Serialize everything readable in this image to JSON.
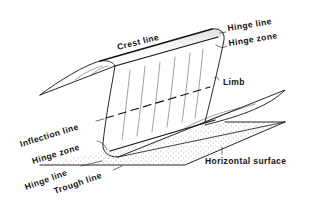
{
  "diagram": {
    "type": "3D fold block diagram",
    "labels": {
      "crest_line": "Crest line",
      "hinge_line_top": "Hinge line",
      "hinge_zone_top": "Hinge zone",
      "limb": "Limb",
      "inflection_line": "Inflection line",
      "hinge_zone_bottom": "Hinge zone",
      "hinge_line_bottom": "Hinge line",
      "trough_line": "Trough line",
      "horizontal_surface": "Horizontal surface"
    },
    "colors": {
      "ink": "#111111",
      "background": "#ffffff",
      "stipple": "#555555"
    }
  }
}
